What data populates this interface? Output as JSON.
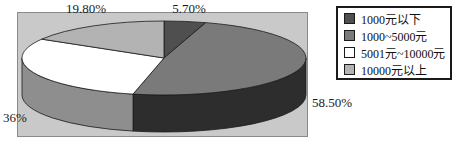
{
  "page": {
    "background": "#ffffff"
  },
  "chart_data": {
    "type": "pie",
    "three_d": true,
    "title": "",
    "start_angle_deg": 0,
    "direction": "clockwise",
    "plot_bg": "#c9c9c9",
    "plot_border": "#8a8a8a",
    "outline_color": "#1a1a1a",
    "slices": [
      {
        "label": "1000元以下",
        "value": 5.7,
        "display": "5.70%",
        "color": "#4f4f4f",
        "side_color": "#2e2e2e"
      },
      {
        "label": "1000~5000元",
        "value": 58.5,
        "display": "58.50%",
        "color": "#7a7a7a",
        "side_color": "#2d2d2d"
      },
      {
        "label": "5001元~10000元",
        "value": 36,
        "display": "36%",
        "color": "#ffffff",
        "side_color": "#8e8e8e"
      },
      {
        "label": "10000元以上",
        "value": 19.8,
        "display": "19.80%",
        "color": "#b3b3b3",
        "side_color": "#7a7a7a"
      }
    ],
    "legend": {
      "position": "right",
      "background": "#ffffff",
      "border": "#1a1a1a"
    }
  }
}
